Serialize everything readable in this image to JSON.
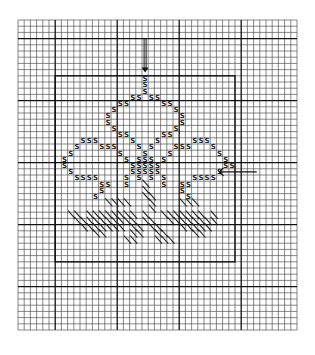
{
  "chart_data": {
    "type": "diagram",
    "title": "",
    "grid": {
      "cols": 45,
      "rows": 50,
      "cell_px": 6.2,
      "origin_px": [
        18,
        20
      ],
      "major_every": 10,
      "major_line_cols": [
        6,
        16,
        26,
        36
      ],
      "major_line_rows": [
        3,
        13,
        23,
        33,
        43
      ],
      "line_color": "#555555",
      "major_line_color": "#111111"
    },
    "inner_rectangle": {
      "col_start": 6,
      "row_start": 9,
      "col_end": 35,
      "row_end": 39
    },
    "center_arrows": [
      {
        "name": "top-center-arrow",
        "direction": "down",
        "col": 20.5,
        "row_from": 3,
        "row_to": 8
      },
      {
        "name": "right-center-arrow",
        "direction": "left",
        "row": 24.5,
        "col_from": 38.5,
        "col_to": 32.5
      }
    ],
    "symbol_legend": [
      {
        "symbol": "S",
        "meaning": "motif stitch"
      },
      {
        "symbol": "/",
        "meaning": "diagonal half-stitch (grass/stem)"
      }
    ],
    "s_cells": [
      [
        20,
        9
      ],
      [
        20,
        10
      ],
      [
        20,
        11
      ],
      [
        18,
        12
      ],
      [
        19,
        12
      ],
      [
        21,
        12
      ],
      [
        22,
        12
      ],
      [
        16,
        13
      ],
      [
        17,
        13
      ],
      [
        23,
        13
      ],
      [
        24,
        13
      ],
      [
        15,
        14
      ],
      [
        25,
        14
      ],
      [
        14,
        15
      ],
      [
        26,
        15
      ],
      [
        14,
        16
      ],
      [
        26,
        16
      ],
      [
        15,
        17
      ],
      [
        25,
        17
      ],
      [
        16,
        18
      ],
      [
        17,
        18
      ],
      [
        23,
        18
      ],
      [
        24,
        18
      ],
      [
        10,
        19
      ],
      [
        11,
        19
      ],
      [
        12,
        19
      ],
      [
        18,
        19
      ],
      [
        22,
        19
      ],
      [
        28,
        19
      ],
      [
        29,
        19
      ],
      [
        30,
        19
      ],
      [
        9,
        20
      ],
      [
        13,
        20
      ],
      [
        14,
        20
      ],
      [
        15,
        20
      ],
      [
        19,
        20
      ],
      [
        21,
        20
      ],
      [
        25,
        20
      ],
      [
        26,
        20
      ],
      [
        27,
        20
      ],
      [
        31,
        20
      ],
      [
        8,
        21
      ],
      [
        16,
        21
      ],
      [
        20,
        21
      ],
      [
        24,
        21
      ],
      [
        32,
        21
      ],
      [
        7,
        22
      ],
      [
        17,
        22
      ],
      [
        19,
        22
      ],
      [
        20,
        22
      ],
      [
        21,
        22
      ],
      [
        23,
        22
      ],
      [
        33,
        22
      ],
      [
        7,
        23
      ],
      [
        18,
        23
      ],
      [
        19,
        23
      ],
      [
        20,
        23
      ],
      [
        21,
        23
      ],
      [
        22,
        23
      ],
      [
        33,
        23
      ],
      [
        34,
        23
      ],
      [
        8,
        24
      ],
      [
        18,
        24
      ],
      [
        19,
        24
      ],
      [
        20,
        24
      ],
      [
        21,
        24
      ],
      [
        22,
        24
      ],
      [
        32,
        24
      ],
      [
        9,
        25
      ],
      [
        10,
        25
      ],
      [
        11,
        25
      ],
      [
        12,
        25
      ],
      [
        17,
        25
      ],
      [
        19,
        25
      ],
      [
        21,
        25
      ],
      [
        23,
        25
      ],
      [
        28,
        25
      ],
      [
        29,
        25
      ],
      [
        30,
        25
      ],
      [
        31,
        25
      ],
      [
        13,
        26
      ],
      [
        14,
        26
      ],
      [
        17,
        26
      ],
      [
        23,
        26
      ],
      [
        26,
        26
      ],
      [
        27,
        26
      ],
      [
        13,
        27
      ],
      [
        26,
        27
      ],
      [
        12,
        28
      ],
      [
        27,
        28
      ]
    ],
    "hatch_cells": [
      [
        20,
        26
      ],
      [
        20,
        27
      ],
      [
        20,
        28
      ],
      [
        21,
        28
      ],
      [
        21,
        29
      ],
      [
        21,
        30
      ],
      [
        14,
        29
      ],
      [
        15,
        29
      ],
      [
        16,
        29
      ],
      [
        17,
        29
      ],
      [
        26,
        29
      ],
      [
        27,
        29
      ],
      [
        28,
        29
      ],
      [
        8,
        31
      ],
      [
        9,
        31
      ],
      [
        11,
        31
      ],
      [
        12,
        31
      ],
      [
        13,
        31
      ],
      [
        14,
        31
      ],
      [
        15,
        31
      ],
      [
        16,
        31
      ],
      [
        17,
        31
      ],
      [
        18,
        31
      ],
      [
        20,
        31
      ],
      [
        23,
        31
      ],
      [
        24,
        31
      ],
      [
        25,
        31
      ],
      [
        26,
        31
      ],
      [
        27,
        31
      ],
      [
        28,
        31
      ],
      [
        29,
        31
      ],
      [
        31,
        31
      ],
      [
        9,
        32
      ],
      [
        10,
        32
      ],
      [
        11,
        32
      ],
      [
        12,
        32
      ],
      [
        13,
        32
      ],
      [
        14,
        32
      ],
      [
        15,
        32
      ],
      [
        16,
        32
      ],
      [
        17,
        32
      ],
      [
        18,
        32
      ],
      [
        20,
        32
      ],
      [
        21,
        32
      ],
      [
        24,
        32
      ],
      [
        25,
        32
      ],
      [
        26,
        32
      ],
      [
        27,
        32
      ],
      [
        28,
        32
      ],
      [
        29,
        32
      ],
      [
        30,
        32
      ],
      [
        31,
        32
      ],
      [
        10,
        33
      ],
      [
        11,
        33
      ],
      [
        12,
        33
      ],
      [
        13,
        33
      ],
      [
        14,
        33
      ],
      [
        15,
        33
      ],
      [
        16,
        33
      ],
      [
        18,
        33
      ],
      [
        19,
        33
      ],
      [
        21,
        33
      ],
      [
        22,
        33
      ],
      [
        26,
        33
      ],
      [
        27,
        33
      ],
      [
        28,
        33
      ],
      [
        29,
        33
      ],
      [
        30,
        33
      ],
      [
        12,
        34
      ],
      [
        13,
        34
      ],
      [
        18,
        34
      ],
      [
        19,
        34
      ],
      [
        22,
        34
      ],
      [
        23,
        34
      ],
      [
        28,
        34
      ],
      [
        29,
        34
      ],
      [
        17,
        35
      ],
      [
        18,
        35
      ],
      [
        22,
        35
      ],
      [
        23,
        35
      ],
      [
        24,
        35
      ]
    ]
  }
}
